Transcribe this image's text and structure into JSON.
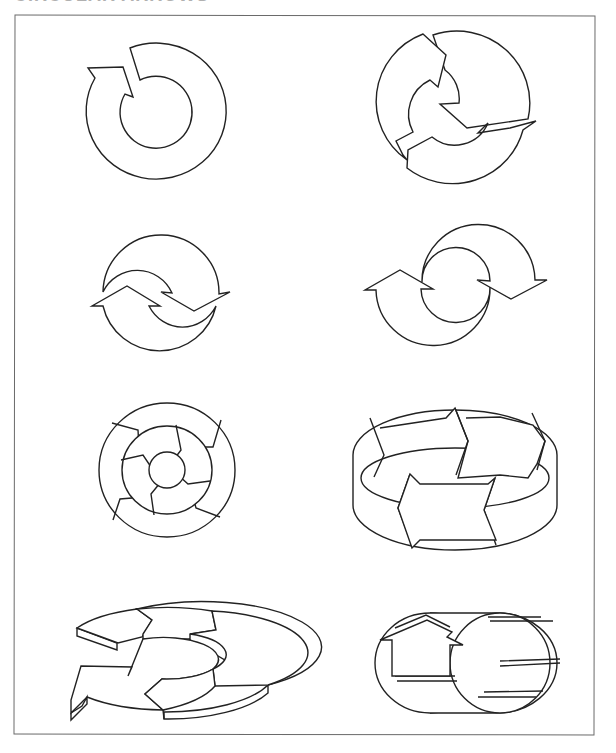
{
  "page": {
    "heading": "CIRCULAR ARROWS",
    "heading_state": "clipped at top edge"
  },
  "diagrams": [
    {
      "id": 1,
      "label": "single-circular-arrow",
      "row": 1,
      "col": 1
    },
    {
      "id": 2,
      "label": "three-segment-circular-arrows",
      "row": 1,
      "col": 2
    },
    {
      "id": 3,
      "label": "two-interlocking-arrows",
      "row": 2,
      "col": 1
    },
    {
      "id": 4,
      "label": "two-offset-circular-arrows",
      "row": 2,
      "col": 2
    },
    {
      "id": 5,
      "label": "concentric-ring-arrows",
      "row": 3,
      "col": 1
    },
    {
      "id": 6,
      "label": "3d-ribbon-band-arrows",
      "row": 3,
      "col": 2
    },
    {
      "id": 7,
      "label": "3d-flat-ring-arrow",
      "row": 4,
      "col": 1
    },
    {
      "id": 8,
      "label": "3d-cylinder-arrow",
      "row": 4,
      "col": 2
    }
  ],
  "colors": {
    "stroke": "#222222",
    "fill": "#ffffff",
    "frame": "#6a6a6a"
  }
}
